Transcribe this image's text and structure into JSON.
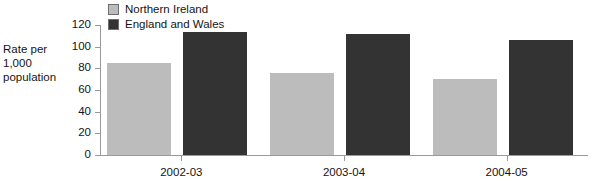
{
  "chart_data": {
    "type": "bar",
    "title": "",
    "subtitle": "",
    "xlabel": "",
    "ylabel": "Rate per 1,000 population",
    "ylabel_lines": [
      "Rate per",
      "1,000",
      "population"
    ],
    "categories": [
      "2002-03",
      "2003-04",
      "2004-05"
    ],
    "series": [
      {
        "name": "Northern Ireland",
        "color": "#bcbcbc",
        "values": [
          85,
          76,
          70
        ]
      },
      {
        "name": "England and Wales",
        "color": "#333333",
        "values": [
          114,
          112,
          106
        ]
      }
    ],
    "ylim": [
      0,
      120
    ],
    "ytick_values": [
      0,
      20,
      40,
      60,
      80,
      100,
      120
    ],
    "ytick_labels": [
      "0",
      "20",
      "40",
      "60",
      "80",
      "100",
      "120"
    ],
    "grid": false,
    "legend_position": "top-left",
    "annotations": []
  }
}
